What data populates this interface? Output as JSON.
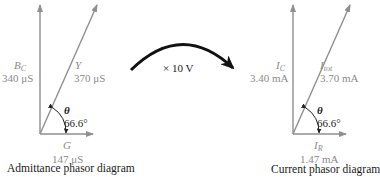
{
  "colors": {
    "phasor_line": "#8f8f8f",
    "label_text": "#8a8a8a",
    "angle_text": "#222222",
    "transform_arrow": "#111111",
    "caption_text": "#1a1a1a"
  },
  "transform": {
    "label": "× 10 V"
  },
  "admittance": {
    "caption": "Admittance phasor diagram",
    "vertical": {
      "symbol": "B",
      "subscript": "C",
      "value": "340 μS"
    },
    "resultant": {
      "symbol": "Y",
      "value": "370 μS"
    },
    "horizontal": {
      "symbol": "G",
      "value": "147 μS"
    },
    "angle": {
      "symbol": "θ",
      "value": "66.6°"
    }
  },
  "current": {
    "caption": "Current phasor diagram",
    "vertical": {
      "symbol": "I",
      "subscript": "C",
      "value": "3.40 mA"
    },
    "resultant": {
      "symbol": "I",
      "subscript": "tot",
      "value": "3.70 mA"
    },
    "horizontal": {
      "symbol": "I",
      "subscript": "R",
      "value": "1.47 mA"
    },
    "angle": {
      "symbol": "θ",
      "value": "66.6°"
    }
  }
}
